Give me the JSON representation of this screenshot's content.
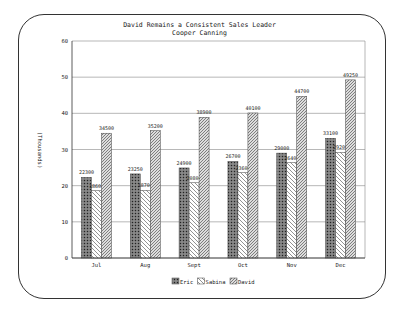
{
  "chart_data": {
    "type": "bar",
    "title": "David Remains a Consistent Sales Leader",
    "subtitle": "Cooper Canning",
    "xlabel": "",
    "ylabel": "(Thousands)",
    "ylim": [
      0,
      60
    ],
    "yticks": [
      0,
      10,
      20,
      30,
      40,
      50,
      60
    ],
    "grid": true,
    "legend_position": "bottom",
    "categories": [
      "Jul",
      "Aug",
      "Sept",
      "Oct",
      "Nov",
      "Dec"
    ],
    "series": [
      {
        "name": "Eric",
        "values": [
          22300,
          23250,
          24900,
          26700,
          29000,
          33100
        ],
        "labels": [
          "22300",
          "23250",
          "24900",
          "26700",
          "29000",
          "33100"
        ]
      },
      {
        "name": "Sabina",
        "values": [
          18600,
          18700,
          20800,
          23600,
          26400,
          29200
        ],
        "labels": [
          "18600",
          "18700",
          "20800",
          "23600",
          "26400",
          "29200"
        ]
      },
      {
        "name": "David",
        "values": [
          34500,
          35200,
          38900,
          40100,
          44700,
          49250
        ],
        "labels": [
          "34500",
          "35200",
          "38900",
          "40100",
          "44700",
          "49250"
        ]
      }
    ]
  },
  "header": {
    "title": "David Remains a Consistent Sales Leader",
    "subtitle": "Cooper Canning"
  },
  "axis": {
    "ylabel": "(Thousands)"
  },
  "legend": {
    "items": [
      "Eric",
      "Sabina",
      "David"
    ]
  }
}
